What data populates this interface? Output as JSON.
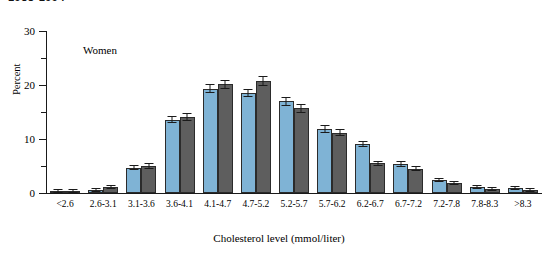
{
  "header": {
    "clipped_text": "1988-1994"
  },
  "chart_data": {
    "type": "bar",
    "title": "",
    "annotation": "Women",
    "xlabel": "Cholesterol level (mmol/liter)",
    "ylabel": "Percent",
    "ylim": [
      0,
      30
    ],
    "ytick_labels": [
      "0",
      "10",
      "20",
      "30"
    ],
    "ytick_values": [
      0,
      10,
      20,
      30
    ],
    "yminor_values": [
      5,
      15,
      25
    ],
    "grid": false,
    "legend_position": "none",
    "categories": [
      "<2.6",
      "2.6-3.1",
      "3.1-3.6",
      "3.6-4.1",
      "4.1-4.7",
      "4.7-5.2",
      "5.2-5.7",
      "5.7-6.2",
      "6.2-6.7",
      "6.7-7.2",
      "7.2-7.8",
      "7.8-8.3",
      ">8.3"
    ],
    "series": [
      {
        "name": "series-light-blue",
        "color": "#7fb3d5",
        "values": [
          0.3,
          0.6,
          4.7,
          13.6,
          19.3,
          18.5,
          17.0,
          11.9,
          9.1,
          5.4,
          2.4,
          1.2,
          0.9
        ],
        "errors": [
          0.2,
          0.3,
          0.5,
          0.7,
          0.8,
          0.8,
          0.8,
          0.7,
          0.6,
          0.5,
          0.4,
          0.3,
          0.3
        ]
      },
      {
        "name": "series-dark-gray",
        "color": "#5e5e5e",
        "values": [
          0.4,
          1.1,
          5.0,
          14.1,
          20.1,
          20.8,
          15.7,
          11.2,
          5.5,
          4.5,
          1.9,
          0.7,
          0.5
        ],
        "errors": [
          0.2,
          0.3,
          0.5,
          0.7,
          0.8,
          0.9,
          0.8,
          0.7,
          0.5,
          0.5,
          0.3,
          0.2,
          0.2
        ]
      }
    ]
  }
}
